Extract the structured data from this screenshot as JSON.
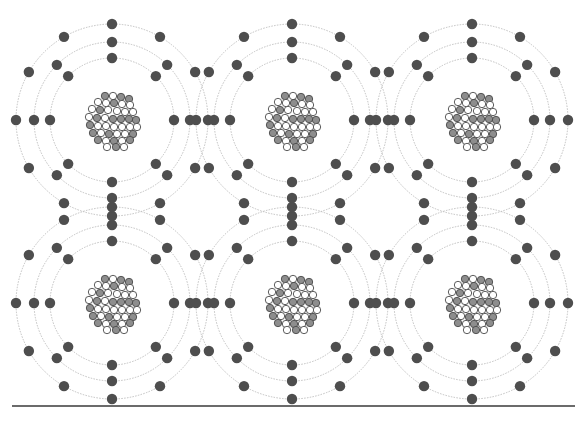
{
  "figure": {
    "background_color": "#ffffff",
    "width": 585,
    "height": 423
  },
  "lattice": {
    "columns": 3,
    "rows": 2,
    "atom_count": 6,
    "column_centers_x": [
      112,
      292,
      472
    ],
    "row_centers_y": [
      120,
      303
    ],
    "label": "atom grid"
  },
  "atom": {
    "label": "atom",
    "nucleus": {
      "label": "nucleus",
      "radius": 26,
      "nucleon_radius": 3.7,
      "proton": {
        "label": "proton",
        "fill_color": "#8d8d8d",
        "stroke_color": "#4a4a4a",
        "count": 20
      },
      "neutron": {
        "label": "neutron",
        "fill_color": "#ffffff",
        "stroke_color": "#4a4a4a",
        "count": 22
      },
      "nucleons": [
        {
          "x": -7,
          "y": -24,
          "type": "proton"
        },
        {
          "x": 1,
          "y": -24,
          "type": "neutron"
        },
        {
          "x": 9,
          "y": -23,
          "type": "proton"
        },
        {
          "x": 17,
          "y": -21,
          "type": "proton"
        },
        {
          "x": -14,
          "y": -18,
          "type": "neutron"
        },
        {
          "x": -6,
          "y": -17,
          "type": "neutron"
        },
        {
          "x": 2,
          "y": -17,
          "type": "proton"
        },
        {
          "x": 10,
          "y": -16,
          "type": "neutron"
        },
        {
          "x": 18,
          "y": -15,
          "type": "neutron"
        },
        {
          "x": -20,
          "y": -11,
          "type": "neutron"
        },
        {
          "x": -12,
          "y": -10,
          "type": "proton"
        },
        {
          "x": -4,
          "y": -10,
          "type": "neutron"
        },
        {
          "x": 5,
          "y": -9,
          "type": "neutron"
        },
        {
          "x": 13,
          "y": -8,
          "type": "neutron"
        },
        {
          "x": 21,
          "y": -8,
          "type": "neutron"
        },
        {
          "x": -23,
          "y": -3,
          "type": "neutron"
        },
        {
          "x": -15,
          "y": -2,
          "type": "proton"
        },
        {
          "x": -7,
          "y": -2,
          "type": "neutron"
        },
        {
          "x": 1,
          "y": -1,
          "type": "proton"
        },
        {
          "x": 9,
          "y": -1,
          "type": "proton"
        },
        {
          "x": 17,
          "y": -1,
          "type": "proton"
        },
        {
          "x": 24,
          "y": 0,
          "type": "proton"
        },
        {
          "x": -22,
          "y": 5,
          "type": "proton"
        },
        {
          "x": -14,
          "y": 6,
          "type": "neutron"
        },
        {
          "x": -6,
          "y": 6,
          "type": "neutron"
        },
        {
          "x": 2,
          "y": 7,
          "type": "neutron"
        },
        {
          "x": 10,
          "y": 7,
          "type": "neutron"
        },
        {
          "x": 18,
          "y": 7,
          "type": "neutron"
        },
        {
          "x": 25,
          "y": 7,
          "type": "neutron"
        },
        {
          "x": -19,
          "y": 13,
          "type": "proton"
        },
        {
          "x": -11,
          "y": 13,
          "type": "neutron"
        },
        {
          "x": -3,
          "y": 14,
          "type": "proton"
        },
        {
          "x": 5,
          "y": 14,
          "type": "neutron"
        },
        {
          "x": 13,
          "y": 14,
          "type": "neutron"
        },
        {
          "x": 21,
          "y": 14,
          "type": "proton"
        },
        {
          "x": -14,
          "y": 20,
          "type": "proton"
        },
        {
          "x": -6,
          "y": 21,
          "type": "neutron"
        },
        {
          "x": 2,
          "y": 21,
          "type": "proton"
        },
        {
          "x": 10,
          "y": 21,
          "type": "neutron"
        },
        {
          "x": 18,
          "y": 20,
          "type": "proton"
        },
        {
          "x": -5,
          "y": 27,
          "type": "neutron"
        },
        {
          "x": 4,
          "y": 27,
          "type": "proton"
        },
        {
          "x": 12,
          "y": 27,
          "type": "neutron"
        }
      ]
    },
    "shells": [
      {
        "name": "inner-shell",
        "index": 1,
        "radius": 62,
        "electron_count": 8,
        "electron_angles_deg": [
          0,
          45,
          90,
          135,
          180,
          225,
          270,
          315
        ]
      },
      {
        "name": "middle-shell",
        "index": 2,
        "radius": 78,
        "electron_count": 8,
        "electron_angles_deg": [
          0,
          45,
          90,
          135,
          180,
          225,
          270,
          315
        ]
      },
      {
        "name": "outer-shell",
        "index": 3,
        "radius": 96,
        "electron_count": 8,
        "electron_angles_deg": [
          0,
          30,
          60,
          90,
          120,
          150,
          180,
          210,
          240,
          270,
          300,
          330
        ]
      }
    ],
    "electron": {
      "label": "electron",
      "radius": 5.2,
      "fill_color": "#4e4e4e"
    },
    "shell_line": {
      "label": "electron shell orbit",
      "stroke_color": "#c0c0c0",
      "stroke_width": 1,
      "dash_pattern": "0.7 2.1"
    }
  },
  "rule": {
    "label": "horizontal rule",
    "x1": 12,
    "x2": 575,
    "y": 406,
    "stroke_color": "#3a3a3a",
    "stroke_width": 1.6
  },
  "caption": {
    "text": "",
    "color": "#d8d8d8"
  }
}
